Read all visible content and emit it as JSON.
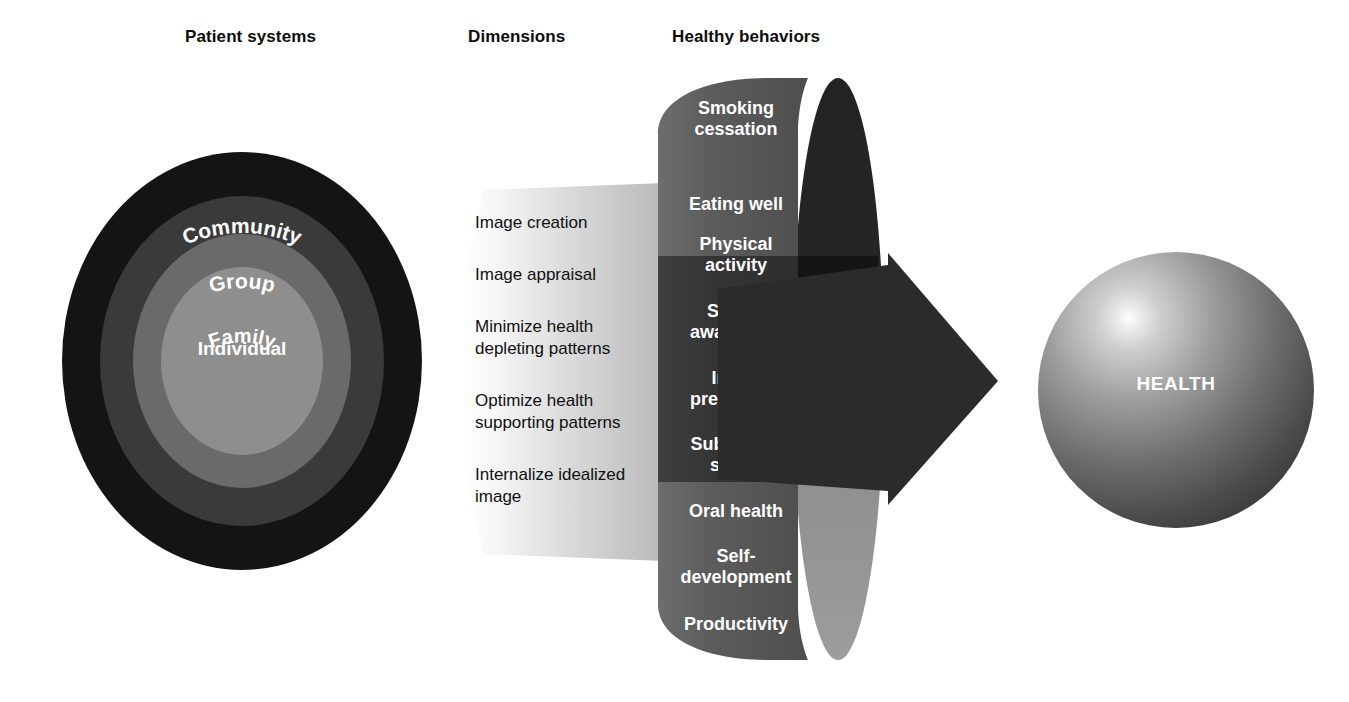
{
  "headings": {
    "patient_systems": "Patient systems",
    "dimensions": "Dimensions",
    "healthy_behaviors": "Healthy behaviors"
  },
  "patient_systems": {
    "rings": [
      {
        "label": "Community",
        "color": "#141414"
      },
      {
        "label": "Group",
        "color": "#3a3a3a"
      },
      {
        "label": "Family",
        "color": "#6a6a6a"
      },
      {
        "label": "Individual",
        "color": "#8e8e8e"
      }
    ]
  },
  "dimensions": {
    "items": [
      "Image creation",
      "Image appraisal",
      "Minimize health\ndepleting patterns",
      "Optimize health\nsupporting patterns",
      "Internalize idealized\nimage"
    ]
  },
  "healthy_behaviors": {
    "items": [
      "Smoking\ncessation",
      "Eating well",
      "Physical\nactivity",
      "Sexual\nawareness",
      "Injury\nprevention",
      "Substance\nsafety",
      "Oral health",
      "Self-\ndevelopment",
      "Productivity"
    ]
  },
  "outcome": {
    "label": "HEALTH"
  },
  "colors": {
    "background": "#ffffff",
    "text": "#000000",
    "ring_outer": "#141414",
    "ring_group": "#3a3a3a",
    "ring_family": "#6a6a6a",
    "ring_individual": "#8e8e8e",
    "cylinder_front": "#5a5a5a",
    "cylinder_shadow": "#2b2b2b",
    "cylinder_side_dark": "#262626",
    "cylinder_side_light": "#9a9a9a",
    "arrow": "#2b2b2b",
    "wedge_light": "#f4f4f4",
    "wedge_mid": "#b9b9b9",
    "sphere_highlight": "#ffffff",
    "sphere_shadow": "#2a2a2a"
  }
}
